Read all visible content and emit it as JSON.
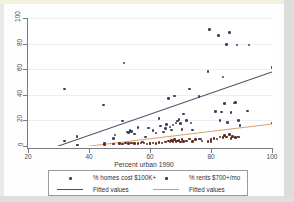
{
  "chart_data": {
    "type": "scatter",
    "title": "",
    "xlabel": "Percent urban 1990",
    "ylabel": "",
    "xlim": [
      20,
      100
    ],
    "ylim": [
      0,
      100
    ],
    "xticks": [
      20,
      40,
      60,
      80,
      100
    ],
    "yticks": [
      0,
      20,
      40,
      60,
      80,
      100
    ],
    "grid": true,
    "legend_position": "below-axis",
    "series": [
      {
        "name": "% homes cost $100K+",
        "marker": "circle",
        "color": "#3d3f5c",
        "points": [
          [
            32.0,
            44.5
          ],
          [
            36.0,
            7.5
          ],
          [
            36.4,
            0.8
          ],
          [
            44.8,
            32.0
          ],
          [
            45.0,
            2.5
          ],
          [
            48.0,
            6.0
          ],
          [
            48.5,
            8.5
          ],
          [
            51.0,
            19.5
          ],
          [
            51.5,
            65.0
          ],
          [
            52.5,
            11.0
          ],
          [
            53.0,
            10.5
          ],
          [
            53.5,
            12.0
          ],
          [
            54.0,
            11.5
          ],
          [
            55.0,
            9.5
          ],
          [
            56.0,
            14.5
          ],
          [
            57.5,
            3.0
          ],
          [
            58.5,
            7.0
          ],
          [
            59.5,
            14.0
          ],
          [
            60.0,
            2.0
          ],
          [
            61.0,
            12.0
          ],
          [
            62.0,
            10.0
          ],
          [
            63.0,
            21.5
          ],
          [
            63.5,
            15.5
          ],
          [
            64.5,
            11.0
          ],
          [
            65.0,
            13.5
          ],
          [
            65.5,
            17.0
          ],
          [
            66.0,
            37.0
          ],
          [
            66.5,
            15.0
          ],
          [
            67.0,
            12.5
          ],
          [
            67.5,
            16.5
          ],
          [
            68.0,
            39.0
          ],
          [
            68.5,
            18.0
          ],
          [
            69.0,
            19.5
          ],
          [
            69.5,
            20.5
          ],
          [
            70.0,
            17.5
          ],
          [
            70.5,
            13.0
          ],
          [
            71.0,
            25.0
          ],
          [
            72.0,
            20.0
          ],
          [
            73.0,
            44.5
          ],
          [
            73.5,
            18.0
          ],
          [
            74.0,
            12.5
          ],
          [
            76.0,
            38.5
          ],
          [
            76.5,
            5.5
          ],
          [
            79.0,
            58.0
          ],
          [
            79.5,
            91.0
          ],
          [
            80.0,
            3.5
          ],
          [
            81.5,
            27.0
          ],
          [
            82.5,
            86.5
          ],
          [
            83.0,
            20.0
          ],
          [
            83.5,
            26.5
          ],
          [
            84.0,
            54.0
          ],
          [
            84.5,
            33.0
          ],
          [
            85.0,
            79.5
          ],
          [
            85.5,
            18.5
          ],
          [
            86.0,
            88.5
          ],
          [
            86.5,
            26.0
          ],
          [
            87.5,
            33.5
          ],
          [
            88.0,
            34.0
          ],
          [
            88.5,
            79.0
          ],
          [
            89.0,
            20.0
          ],
          [
            89.5,
            16.0
          ],
          [
            92.0,
            27.5
          ],
          [
            92.5,
            79.0
          ],
          [
            100.0,
            61.5
          ]
        ]
      },
      {
        "name": "% rents $700+/mo",
        "marker": "circle",
        "color": "#5e2a23",
        "points": [
          [
            32.0,
            4.0
          ],
          [
            36.0,
            0.6
          ],
          [
            45.0,
            1.0
          ],
          [
            48.0,
            1.5
          ],
          [
            50.0,
            2.0
          ],
          [
            51.0,
            1.5
          ],
          [
            52.0,
            2.5
          ],
          [
            53.0,
            2.0
          ],
          [
            54.0,
            2.2
          ],
          [
            55.0,
            2.0
          ],
          [
            56.0,
            1.8
          ],
          [
            57.0,
            2.5
          ],
          [
            58.0,
            2.2
          ],
          [
            59.0,
            1.5
          ],
          [
            60.0,
            2.0
          ],
          [
            61.0,
            2.4
          ],
          [
            62.0,
            2.0
          ],
          [
            63.0,
            2.8
          ],
          [
            64.0,
            2.2
          ],
          [
            65.0,
            3.0
          ],
          [
            66.0,
            4.0
          ],
          [
            66.5,
            3.0
          ],
          [
            67.0,
            4.5
          ],
          [
            67.5,
            3.5
          ],
          [
            68.0,
            5.0
          ],
          [
            68.5,
            3.5
          ],
          [
            69.0,
            4.0
          ],
          [
            69.5,
            4.5
          ],
          [
            70.0,
            3.0
          ],
          [
            70.5,
            5.0
          ],
          [
            71.0,
            3.5
          ],
          [
            72.0,
            4.0
          ],
          [
            73.0,
            5.5
          ],
          [
            74.0,
            3.5
          ],
          [
            75.0,
            5.0
          ],
          [
            76.0,
            5.5
          ],
          [
            77.0,
            4.0
          ],
          [
            79.0,
            3.5
          ],
          [
            80.0,
            5.0
          ],
          [
            81.0,
            6.0
          ],
          [
            82.0,
            5.5
          ],
          [
            83.0,
            7.0
          ],
          [
            84.0,
            6.5
          ],
          [
            84.5,
            8.0
          ],
          [
            85.0,
            7.0
          ],
          [
            86.0,
            9.0
          ],
          [
            86.5,
            6.0
          ],
          [
            87.0,
            7.5
          ],
          [
            88.0,
            6.5
          ],
          [
            89.0,
            7.0
          ],
          [
            100.0,
            18.0
          ]
        ]
      }
    ],
    "fits": [
      {
        "name": "Fitted values",
        "color": "#4c4e68",
        "for_series": "% homes cost $100K+",
        "x0": 20.0,
        "y0": -8.0,
        "x1": 100.0,
        "y1": 58.0
      },
      {
        "name": "Fitted values",
        "color": "#d9a06a",
        "for_series": "% rents $700+/mo",
        "x0": 20.0,
        "y0": -5.5,
        "x1": 100.0,
        "y1": 17.5
      }
    ]
  },
  "axes": {
    "y_tick_labels": [
      "0",
      "20",
      "40",
      "60",
      "80",
      "100"
    ],
    "x_tick_labels": [
      "20",
      "40",
      "60",
      "80",
      "100"
    ],
    "x_axis_title": "Percent urban 1990"
  },
  "legend": {
    "entries": [
      {
        "label": "% homes cost $100K+",
        "key": "marker",
        "color": "#3d3f5c"
      },
      {
        "label": "% rents $700+/mo",
        "key": "marker",
        "color": "#5e2a23"
      },
      {
        "label": "Fitted values",
        "key": "line",
        "color": "#4c4e68"
      },
      {
        "label": "Fitted values",
        "key": "line",
        "color": "#d9a06a"
      }
    ]
  }
}
